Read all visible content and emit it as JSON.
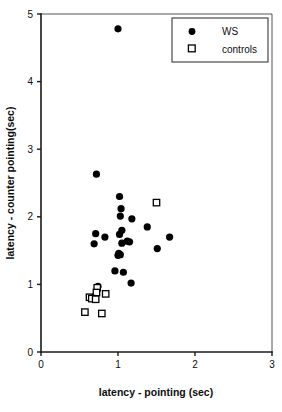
{
  "chart_data": {
    "type": "scatter",
    "title": "",
    "xlabel": "latency - pointing (sec)",
    "ylabel": "latency - counter pointing(sec)",
    "xlim": [
      0,
      3
    ],
    "ylim": [
      0,
      5
    ],
    "xticks": [
      "0",
      "1",
      "2",
      "3"
    ],
    "xtick_values": [
      0,
      1,
      2,
      3
    ],
    "yticks": [
      "0",
      "1",
      "2",
      "3",
      "4",
      "5"
    ],
    "ytick_values": [
      0,
      1,
      2,
      3,
      4,
      5
    ],
    "grid": false,
    "legend_position": "top-right",
    "series": [
      {
        "name": "WS",
        "marker": "filled-circle",
        "color": "#000000",
        "points": [
          [
            1.0,
            4.78
          ],
          [
            0.72,
            2.63
          ],
          [
            1.02,
            2.3
          ],
          [
            1.04,
            2.12
          ],
          [
            1.03,
            2.01
          ],
          [
            1.18,
            1.97
          ],
          [
            1.38,
            1.85
          ],
          [
            1.05,
            1.8
          ],
          [
            0.71,
            1.75
          ],
          [
            1.02,
            1.74
          ],
          [
            0.83,
            1.7
          ],
          [
            1.67,
            1.7
          ],
          [
            1.12,
            1.64
          ],
          [
            1.15,
            1.63
          ],
          [
            1.05,
            1.61
          ],
          [
            0.69,
            1.6
          ],
          [
            1.51,
            1.53
          ],
          [
            1.01,
            1.46
          ],
          [
            1.03,
            1.44
          ],
          [
            1.0,
            1.43
          ],
          [
            0.96,
            1.2
          ],
          [
            1.07,
            1.18
          ],
          [
            1.17,
            1.02
          ],
          [
            0.74,
            0.97
          ]
        ]
      },
      {
        "name": "controls",
        "marker": "open-square",
        "color": "#000000",
        "points": [
          [
            1.5,
            2.21
          ],
          [
            0.73,
            0.95
          ],
          [
            0.72,
            0.88
          ],
          [
            0.84,
            0.86
          ],
          [
            0.63,
            0.81
          ],
          [
            0.66,
            0.79
          ],
          [
            0.71,
            0.78
          ],
          [
            0.57,
            0.59
          ],
          [
            0.79,
            0.57
          ]
        ]
      }
    ]
  },
  "legend": {
    "entries": [
      {
        "label": "WS",
        "marker": "filled-circle"
      },
      {
        "label": "controls",
        "marker": "open-square"
      }
    ]
  }
}
